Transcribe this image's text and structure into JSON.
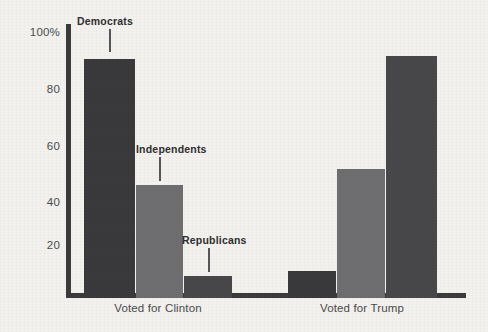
{
  "chart_data": {
    "type": "bar",
    "title": "",
    "subtitle": "",
    "xlabel": "",
    "ylabel": "",
    "ylim": [
      0,
      100
    ],
    "yticks": [
      0,
      20,
      40,
      60,
      80,
      100
    ],
    "ytick_labels": [
      "",
      "20",
      "40",
      "60",
      "80",
      "100%"
    ],
    "grid": false,
    "legend_position": "inline-annotations",
    "categories": [
      "Voted for Clinton",
      "Voted for Trump"
    ],
    "series": [
      {
        "name": "Democrats",
        "values": [
          89,
          10
        ],
        "color": "#3a3a3c"
      },
      {
        "name": "Independents",
        "values": [
          42,
          48
        ],
        "color": "#6e6e70"
      },
      {
        "name": "Republicans",
        "values": [
          8,
          90
        ],
        "color": "#48484a"
      }
    ],
    "annotations": [
      {
        "label": "Democrats",
        "group": "Voted for Clinton",
        "series": "Democrats"
      },
      {
        "label": "Independents",
        "group": "Voted for Clinton",
        "series": "Independents"
      },
      {
        "label": "Republicans",
        "group": "Voted for Clinton",
        "series": "Republicans"
      }
    ]
  },
  "axis": {
    "y_tick_100": "100%",
    "y_tick_80": "80",
    "y_tick_60": "60",
    "y_tick_40": "40",
    "y_tick_20": "20"
  },
  "groups": {
    "clinton_label": "Voted for Clinton",
    "trump_label": "Voted for Trump"
  },
  "annotations": {
    "democrats": "Democrats",
    "independents": "Independents",
    "republicans": "Republicans"
  },
  "colors": {
    "background": "#f2f1ee",
    "axis": "#3b3b3d",
    "democrats": "#3a3a3c",
    "independents": "#6e6e70",
    "republicans": "#48484a",
    "text": "#4a4a4c",
    "annotation_text": "#2e2e30"
  }
}
